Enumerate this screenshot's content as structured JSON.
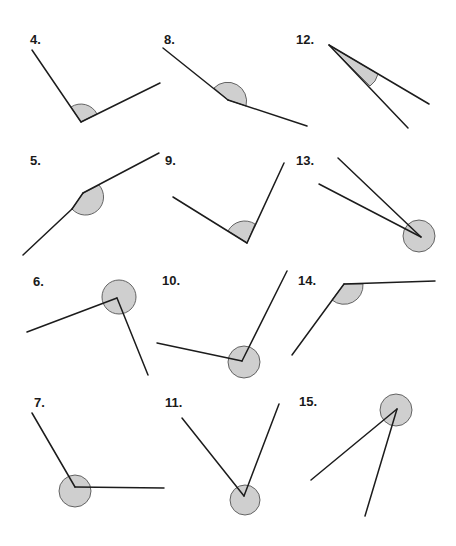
{
  "worksheet": {
    "shade_color": "#cfcfcf",
    "line_color": "#1c1c1c",
    "angles": [
      {
        "number": "4.",
        "label_pos": [
          30,
          33
        ],
        "vertex": [
          81,
          122
        ],
        "arm1": [
          32,
          50
        ],
        "arm2": [
          160,
          83
        ],
        "shaded": "reflex-small-arc",
        "type": "obtuse"
      },
      {
        "number": "8.",
        "label_pos": [
          164,
          33
        ],
        "vertex": [
          228,
          100
        ],
        "arm1": [
          163,
          48
        ],
        "arm2": [
          307,
          126
        ],
        "type": "obtuse"
      },
      {
        "number": "12.",
        "label_pos": [
          296,
          33
        ],
        "vertex": [
          329,
          45
        ],
        "arm1": [
          429,
          104
        ],
        "arm2": [
          408,
          128
        ],
        "type": "acute"
      },
      {
        "number": "5.",
        "label_pos": [
          30,
          154
        ],
        "vertex": [
          83,
          193
        ],
        "arm1": [
          23,
          255
        ],
        "arm2": [
          159,
          153
        ],
        "type": "obtuse"
      },
      {
        "number": "9.",
        "label_pos": [
          165,
          154
        ],
        "vertex": [
          247,
          243
        ],
        "arm1": [
          173,
          197
        ],
        "arm2": [
          284,
          163
        ],
        "type": "obtuse"
      },
      {
        "number": "13.",
        "label_pos": [
          296,
          154
        ],
        "vertex": [
          421,
          237
        ],
        "arm1": [
          338,
          158
        ],
        "arm2": [
          319,
          184
        ],
        "type": "reflex"
      },
      {
        "number": "6.",
        "label_pos": [
          33,
          275
        ],
        "vertex": [
          117,
          298
        ],
        "arm1": [
          27,
          332
        ],
        "arm2": [
          148,
          375
        ],
        "type": "reflex"
      },
      {
        "number": "10.",
        "label_pos": [
          162,
          274
        ],
        "vertex": [
          242,
          361
        ],
        "arm1": [
          157,
          343
        ],
        "arm2": [
          287,
          271
        ],
        "type": "reflex"
      },
      {
        "number": "14.",
        "label_pos": [
          298,
          274
        ],
        "vertex": [
          344,
          284
        ],
        "arm1": [
          292,
          355
        ],
        "arm2": [
          435,
          281
        ],
        "type": "obtuse"
      },
      {
        "number": "7.",
        "label_pos": [
          34,
          396
        ],
        "vertex": [
          75,
          487
        ],
        "arm1": [
          32,
          413
        ],
        "arm2": [
          164,
          488
        ],
        "type": "reflex"
      },
      {
        "number": "11.",
        "label_pos": [
          165,
          396
        ],
        "vertex": [
          244,
          496
        ],
        "arm1": [
          182,
          418
        ],
        "arm2": [
          279,
          404
        ],
        "type": "reflex"
      },
      {
        "number": "15.",
        "label_pos": [
          299,
          395
        ],
        "vertex": [
          397,
          409
        ],
        "arm1": [
          311,
          480
        ],
        "arm2": [
          365,
          516
        ],
        "type": "reflex"
      }
    ]
  },
  "labels": {
    "a4": "4.",
    "a8": "8.",
    "a12": "12.",
    "a5": "5.",
    "a9": "9.",
    "a13": "13.",
    "a6": "6.",
    "a10": "10.",
    "a14": "14.",
    "a7": "7.",
    "a11": "11.",
    "a15": "15."
  }
}
